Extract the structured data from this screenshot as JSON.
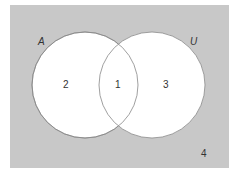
{
  "diagram": {
    "type": "venn",
    "universe_label": "U",
    "set_label": "A",
    "regions": {
      "left_only": "2",
      "intersection": "1",
      "right_only": "3",
      "outside": "4"
    },
    "colors": {
      "background": "#c8c8c8",
      "circle_fill": "#ffffff",
      "circle_stroke": "#888888"
    }
  }
}
